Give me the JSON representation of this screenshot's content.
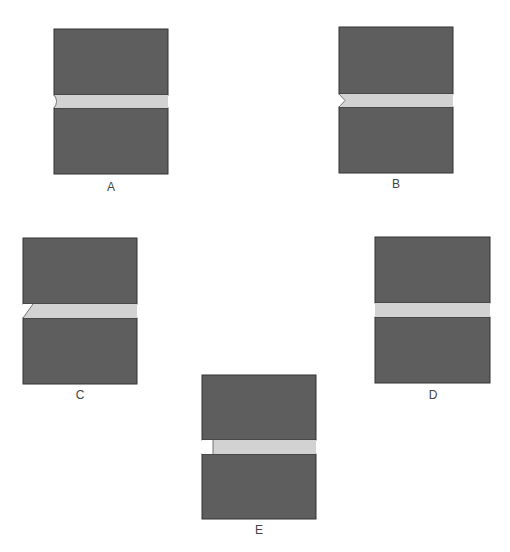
{
  "figure": {
    "colors": {
      "substrate": "#5e5e5e",
      "substrate_edge": "#333333",
      "filler": "#d2d2d2",
      "label_text": "#444444"
    },
    "panels": [
      {
        "id": "A",
        "label": "A",
        "edge_profile": "concave (rounded notch)"
      },
      {
        "id": "B",
        "label": "B",
        "edge_profile": "V-notch"
      },
      {
        "id": "C",
        "label": "C",
        "edge_profile": "beveled / tapered"
      },
      {
        "id": "D",
        "label": "D",
        "edge_profile": "flush"
      },
      {
        "id": "E",
        "label": "E",
        "edge_profile": "recessed (starved joint)"
      }
    ]
  }
}
